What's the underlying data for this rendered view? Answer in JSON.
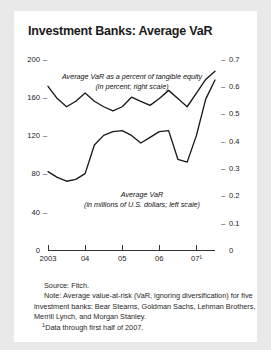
{
  "card": {
    "title": "Investment Banks: Average VaR"
  },
  "notes": {
    "source": "Source: Fitch.",
    "note": "Note: Average value-at-risk (VaR, ignoring diversification) for five investment banks: Bear Stearns, Goldman Sachs, Lehman Brothers, Merrill Lynch, and Morgan Stanley.",
    "footnote_marker": "1",
    "footnote": "Data through first half of 2007."
  },
  "chart_data": {
    "type": "line",
    "title": "Investment Banks: Average VaR",
    "xlabel": "",
    "grid": false,
    "legend": "in-plot annotations",
    "x_tick_labels": [
      "2003",
      "04",
      "05",
      "06",
      "07¹"
    ],
    "x_tick_positions": [
      0,
      4,
      8,
      12,
      16
    ],
    "left_axis": {
      "label": "Average VaR (in millions of U.S. dollars; left scale)",
      "ticks": [
        0,
        40,
        80,
        120,
        160,
        200
      ],
      "ylim": [
        0,
        200
      ]
    },
    "right_axis": {
      "label": "Average VaR as a percent of tangible equity (in percent; right scale)",
      "ticks": [
        0,
        0.1,
        0.2,
        0.3,
        0.4,
        0.5,
        0.6,
        0.7
      ],
      "ylim": [
        0,
        0.7
      ]
    },
    "annotations": [
      {
        "id": "pct-annotation",
        "line1": "Average VaR as a percent of tangible equity",
        "line2": "(in percent; right scale)"
      },
      {
        "id": "usd-annotation",
        "line1": "Average VaR",
        "line2": "(in millions of U.S. dollars; left scale)"
      }
    ],
    "series": [
      {
        "name": "Average VaR as a percent of tangible equity",
        "axis": "right",
        "unit": "percent",
        "values": [
          0.6,
          0.555,
          0.525,
          0.545,
          0.575,
          0.545,
          0.525,
          0.51,
          0.525,
          0.56,
          0.545,
          0.53,
          0.555,
          0.585,
          0.555,
          0.525,
          0.575,
          0.625,
          0.655
        ]
      },
      {
        "name": "Average VaR",
        "axis": "left",
        "unit": "millions of U.S. dollars",
        "values": [
          82,
          76,
          72,
          74,
          80,
          110,
          120,
          124,
          125,
          120,
          112,
          118,
          124,
          125,
          95,
          92,
          120,
          158,
          178
        ]
      }
    ]
  }
}
